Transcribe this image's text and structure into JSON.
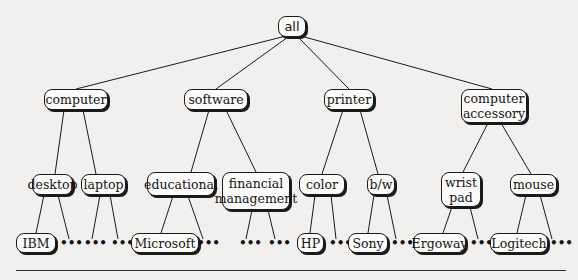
{
  "diagram": {
    "type": "concept-hierarchy-tree",
    "root": {
      "label": "all"
    },
    "level1": [
      {
        "label": "computer"
      },
      {
        "label": "software"
      },
      {
        "label": "printer"
      },
      {
        "label": "computer\naccessory"
      }
    ],
    "level2": [
      {
        "label": "desktop",
        "parent": "computer"
      },
      {
        "label": "laptop",
        "parent": "computer"
      },
      {
        "label": "educational",
        "parent": "software"
      },
      {
        "label": "financial\nmanagement",
        "parent": "software"
      },
      {
        "label": "color",
        "parent": "printer"
      },
      {
        "label": "b/w",
        "parent": "printer"
      },
      {
        "label": "wrist\npad",
        "parent": "computer accessory"
      },
      {
        "label": "mouse",
        "parent": "computer accessory"
      }
    ],
    "level3": [
      {
        "label": "IBM",
        "parent": "desktop"
      },
      {
        "label": "Microsoft",
        "parent": "educational"
      },
      {
        "label": "HP",
        "parent": "color"
      },
      {
        "label": "Sony",
        "parent": "b/w"
      },
      {
        "label": "Ergoway",
        "parent": "wrist pad"
      },
      {
        "label": "Logitech",
        "parent": "mouse"
      }
    ],
    "ellipsis": "•••",
    "colors": {
      "line": "#1a1a1a",
      "node_fill": "#fbfbf9",
      "background": "#f1f0ee"
    }
  }
}
